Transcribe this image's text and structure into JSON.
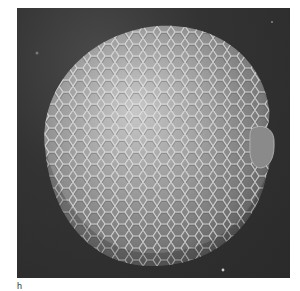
{
  "figure": {
    "type": "scanning electron micrograph",
    "panel_label": "h",
    "colors": {
      "background": "#2e2e2e",
      "seed_light": "#d8d8d8",
      "seed_mid": "#9a9a9a",
      "seed_dark": "#555555",
      "page": "#ffffff"
    }
  }
}
